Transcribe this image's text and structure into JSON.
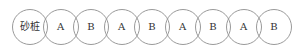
{
  "diagram": {
    "type": "overlapping-circle-row",
    "stroke_color": "#9a9a9a",
    "circles": [
      {
        "label": "砂桩"
      },
      {
        "label": "A"
      },
      {
        "label": "B"
      },
      {
        "label": "A"
      },
      {
        "label": "B"
      },
      {
        "label": "A"
      },
      {
        "label": "B"
      },
      {
        "label": "A"
      },
      {
        "label": "B"
      }
    ]
  }
}
